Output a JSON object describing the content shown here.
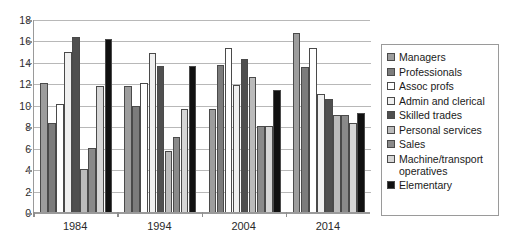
{
  "chart_data": {
    "type": "bar",
    "title": "",
    "xlabel": "",
    "ylabel": "",
    "categories": [
      "1984",
      "1994",
      "2004",
      "2014"
    ],
    "ylim": [
      0,
      18
    ],
    "ytick_values": [
      0,
      2,
      4,
      6,
      8,
      10,
      12,
      14,
      16,
      18
    ],
    "ytick_labels": [
      "0",
      "2",
      "4",
      "6",
      "8",
      "10",
      "12",
      "14",
      "16",
      "18"
    ],
    "grid": true,
    "legend_position": "right",
    "series": [
      {
        "name": "Managers",
        "color": "#9d9d9d",
        "values": [
          12.1,
          11.8,
          9.7,
          16.8
        ]
      },
      {
        "name": "Professionals",
        "color": "#7c7c7c",
        "values": [
          8.4,
          10.0,
          13.8,
          13.6
        ]
      },
      {
        "name": "Assoc profs",
        "color": "#ffffff",
        "values": [
          10.2,
          12.1,
          15.4,
          15.4
        ]
      },
      {
        "name": "Admin and clerical",
        "color": "#f0f0f0",
        "values": [
          15.0,
          14.9,
          11.9,
          11.1
        ]
      },
      {
        "name": "Skilled trades",
        "color": "#4f4f4f",
        "values": [
          16.4,
          13.7,
          14.4,
          10.6
        ]
      },
      {
        "name": "Personal services",
        "color": "#bbbbbb",
        "values": [
          4.1,
          5.8,
          12.7,
          9.1
        ]
      },
      {
        "name": "Sales",
        "color": "#8a8a8a",
        "values": [
          6.1,
          7.1,
          8.1,
          9.1
        ]
      },
      {
        "name": "Machine/transport operatives",
        "color": "#d6d6d6",
        "values": [
          11.8,
          9.7,
          8.1,
          8.4
        ]
      },
      {
        "name": "Elementary",
        "color": "#111111",
        "values": [
          16.2,
          13.7,
          11.5,
          9.3
        ]
      }
    ]
  },
  "legend": {
    "entries": [
      "Managers",
      "Professionals",
      "Assoc profs",
      "Admin and clerical",
      "Skilled trades",
      "Personal services",
      "Sales",
      "Machine/transport operatives",
      "Elementary"
    ]
  },
  "colors": {
    "axis": "#9a9a9a",
    "grid": "#b8b8b8",
    "text": "#1a1a1a",
    "background": "#ffffff",
    "bar_outline": "#4a4a4a"
  }
}
